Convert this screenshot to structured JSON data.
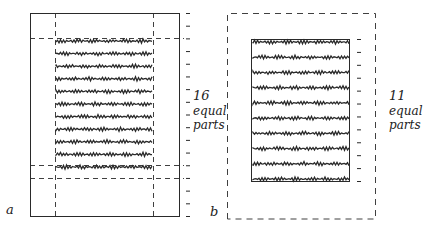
{
  "diagram": {
    "ink_color": "#2a2a2a",
    "background": "#ffffff",
    "panel_a": {
      "label": "a",
      "divisions_label": [
        "16",
        "equal",
        "parts"
      ],
      "divisions": 16,
      "text_lines": 11
    },
    "panel_b": {
      "label": "b",
      "divisions_label": [
        "11",
        "equal",
        "parts"
      ],
      "divisions": 11,
      "text_lines": 10
    }
  }
}
